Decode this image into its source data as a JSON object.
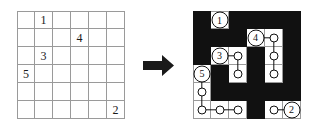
{
  "figure": {
    "title": "Nurikabe puzzle and its solution",
    "arrow_label": "right-arrow",
    "grid_size": 6
  },
  "puzzle": {
    "label": "puzzle-grid",
    "rows": 6,
    "cols": 6,
    "clues": [
      {
        "row": 1,
        "col": 2,
        "value": "1"
      },
      {
        "row": 2,
        "col": 4,
        "value": "4"
      },
      {
        "row": 3,
        "col": 2,
        "value": "3"
      },
      {
        "row": 4,
        "col": 1,
        "value": "5"
      },
      {
        "row": 6,
        "col": 6,
        "value": "2"
      }
    ]
  },
  "solution": {
    "label": "solution-grid",
    "rows": 6,
    "cols": 6,
    "clues": [
      {
        "row": 1,
        "col": 2,
        "value": "1"
      },
      {
        "row": 2,
        "col": 4,
        "value": "4"
      },
      {
        "row": 3,
        "col": 2,
        "value": "3"
      },
      {
        "row": 4,
        "col": 1,
        "value": "5"
      },
      {
        "row": 6,
        "col": 6,
        "value": "2"
      }
    ],
    "black_cells": [
      [
        1,
        1
      ],
      [
        1,
        3
      ],
      [
        1,
        4
      ],
      [
        1,
        5
      ],
      [
        1,
        6
      ],
      [
        2,
        1
      ],
      [
        2,
        2
      ],
      [
        2,
        3
      ],
      [
        2,
        6
      ],
      [
        3,
        1
      ],
      [
        3,
        4
      ],
      [
        3,
        6
      ],
      [
        4,
        2
      ],
      [
        4,
        4
      ],
      [
        4,
        6
      ],
      [
        5,
        2
      ],
      [
        5,
        3
      ],
      [
        5,
        4
      ],
      [
        5,
        5
      ],
      [
        5,
        6
      ],
      [
        6,
        4
      ]
    ],
    "island_dots": [
      [
        3,
        3
      ],
      [
        4,
        3
      ],
      [
        2,
        5
      ],
      [
        3,
        5
      ],
      [
        4,
        5
      ],
      [
        5,
        1
      ],
      [
        6,
        1
      ],
      [
        6,
        2
      ],
      [
        6,
        3
      ],
      [
        6,
        5
      ]
    ],
    "links_right": [
      [
        3,
        2
      ],
      [
        2,
        4
      ],
      [
        6,
        1
      ],
      [
        6,
        2
      ],
      [
        6,
        5
      ]
    ],
    "links_down": [
      [
        3,
        3
      ],
      [
        2,
        5
      ],
      [
        3,
        5
      ],
      [
        4,
        1
      ],
      [
        5,
        1
      ]
    ],
    "colors": {
      "wall": "#111111",
      "island": "#ffffff",
      "gridline": "#9a9a9a"
    }
  }
}
